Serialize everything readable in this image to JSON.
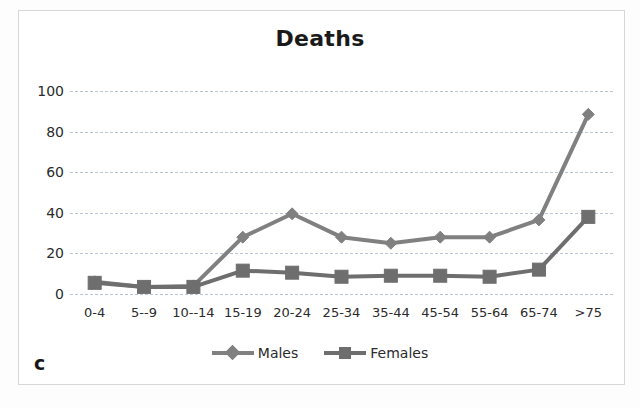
{
  "panel": {
    "letter": "c"
  },
  "chart_data": {
    "type": "line",
    "title": "Deaths",
    "xlabel": "",
    "ylabel": "",
    "categories": [
      "0-4",
      "5--9",
      "10--14",
      "15-19",
      "20-24",
      "25-34",
      "35-44",
      "45-54",
      "55-64",
      "65-74",
      ">75"
    ],
    "series": [
      {
        "name": "Males",
        "marker": "diamond",
        "color": "#808080",
        "values": [
          6,
          3.5,
          4,
          28,
          39.5,
          28,
          25,
          28,
          28,
          36.5,
          88.5
        ]
      },
      {
        "name": "Females",
        "marker": "square",
        "color": "#6e6e6e",
        "values": [
          5.5,
          3.5,
          3.5,
          11.5,
          10.5,
          8.5,
          9,
          9,
          8.5,
          12,
          38
        ]
      }
    ],
    "ylim": [
      0,
      100
    ],
    "yticks": [
      0,
      20,
      40,
      60,
      80,
      100
    ],
    "ytick_labels": [
      "0",
      "20",
      "40",
      "60",
      "80",
      "100"
    ],
    "grid": true,
    "grid_color": "#b9c4d6",
    "legend_position": "bottom"
  }
}
